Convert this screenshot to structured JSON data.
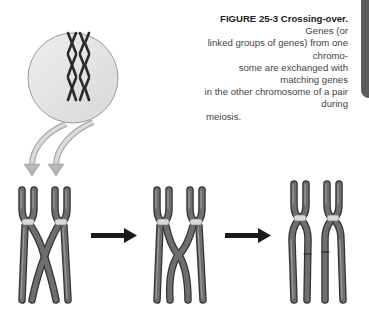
{
  "figure": {
    "label": "FIGURE 25-3",
    "title": "Crossing-over.",
    "caption_lines": [
      "Genes (or",
      "linked groups of genes) from one chromo-",
      "some are exchanged with matching genes",
      "in the other chromosome of a pair during",
      "meiosis."
    ],
    "caption_body": "Genes (or linked groups of genes) from one chromosome are exchanged with matching genes in the other chromosome of a pair during meiosis."
  },
  "diagram": {
    "inset": "cell-with-three-chromosome-pairs",
    "stages": [
      "homologous-pair-crossing",
      "chiasma-exchange",
      "recombined-chromosomes"
    ],
    "colors": {
      "chromosome": "#555555",
      "chromosome_highlight": "#8a8a8a",
      "centromere": "#d9d9d9",
      "cell_fill": "#e4e4e4",
      "cell_stroke": "#9a9a9a",
      "arrow": "#1a1a1a",
      "tab": "#5a5a5a"
    }
  }
}
